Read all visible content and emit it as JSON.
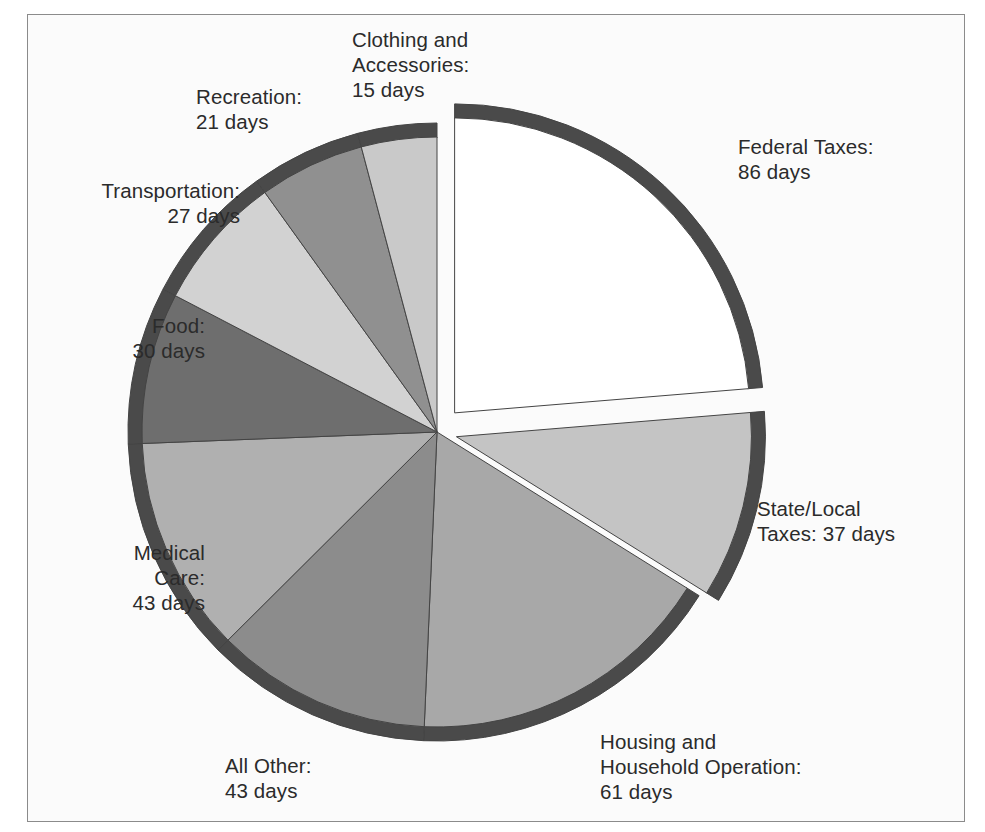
{
  "figure": {
    "kind": "exploded-pie-chart",
    "background": "#fbfbfb",
    "frame_color": "#8b8b8b",
    "label_color": "#2b2b2b",
    "rim_color": "#4a4a4a",
    "edge_color": "#444444"
  },
  "labels": {
    "clothing": "Clothing and\nAccessories:\n15 days",
    "recreation": "Recreation:\n21 days",
    "transportation": "Transportation:\n27 days",
    "food": "Food:\n30 days",
    "medical": "Medical\nCare:\n43 days",
    "all_other": "All Other:\n43 days",
    "housing": "Housing and\nHousehold Operation:\n61 days",
    "federal": "Federal Taxes:\n86 days",
    "state_local": "State/Local\nTaxes: 37 days"
  },
  "chart_data": {
    "type": "pie",
    "title": "",
    "units": "days",
    "total": 363,
    "start_angle_deg": -90,
    "direction": "clockwise",
    "center": [
      437,
      432
    ],
    "radius": 309,
    "categories": [
      "Federal Taxes",
      "State/Local Taxes",
      "Housing and Household Operation",
      "All Other",
      "Medical Care",
      "Food",
      "Transportation",
      "Recreation",
      "Clothing and Accessories"
    ],
    "values": [
      86,
      37,
      61,
      43,
      43,
      30,
      27,
      21,
      15
    ],
    "slices": [
      {
        "name": "Federal Taxes",
        "value": 86,
        "label": "Federal Taxes:\n86 days",
        "color": "#ffffff",
        "exploded": true,
        "explode_offset": 26
      },
      {
        "name": "State/Local Taxes",
        "value": 37,
        "label": "State/Local\nTaxes: 37 days",
        "color": "#c4c4c4",
        "exploded": true,
        "explode_offset": 20
      },
      {
        "name": "Housing and Household Operation",
        "value": 61,
        "label": "Housing and\nHousehold Operation:\n61 days",
        "color": "#a8a8a8",
        "exploded": false,
        "explode_offset": 0
      },
      {
        "name": "All Other",
        "value": 43,
        "label": "All Other:\n43 days",
        "color": "#8c8c8c",
        "exploded": false,
        "explode_offset": 0
      },
      {
        "name": "Medical Care",
        "value": 43,
        "label": "Medical\nCare:\n43 days",
        "color": "#b0b0b0",
        "exploded": false,
        "explode_offset": 0
      },
      {
        "name": "Food",
        "value": 30,
        "label": "Food:\n30 days",
        "color": "#6e6e6e",
        "exploded": false,
        "explode_offset": 0
      },
      {
        "name": "Transportation",
        "value": 27,
        "label": "Transportation:\n27 days",
        "color": "#d2d2d2",
        "exploded": false,
        "explode_offset": 0
      },
      {
        "name": "Recreation",
        "value": 21,
        "label": "Recreation:\n21 days",
        "color": "#909090",
        "exploded": false,
        "explode_offset": 0
      },
      {
        "name": "Clothing and Accessories",
        "value": 15,
        "label": "Clothing and\nAccessories:\n15 days",
        "color": "#c9c9c9",
        "exploded": false,
        "explode_offset": 0
      }
    ],
    "legend": "labels-outside",
    "grid": false
  }
}
